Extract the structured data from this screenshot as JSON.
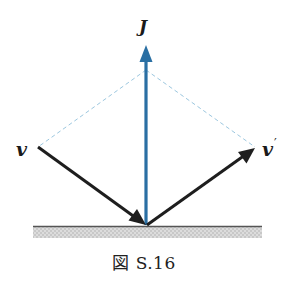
{
  "figure": {
    "caption": "図 S.16",
    "vectors": {
      "J": {
        "label": "J",
        "color": "#2a6fa3",
        "from": [
          146,
          225
        ],
        "to": [
          146,
          45
        ]
      },
      "v": {
        "label": "v",
        "color": "#1e1e1e",
        "from": [
          38,
          147
        ],
        "to": [
          146,
          225
        ]
      },
      "v_prime": {
        "label": "v",
        "prime": "′",
        "color": "#1e1e1e",
        "from": [
          146,
          225
        ],
        "to": [
          255,
          148
        ]
      }
    },
    "construction_lines": {
      "color": "#9cc7df",
      "apex": [
        146,
        70
      ],
      "left_end": [
        38,
        147
      ],
      "right_end": [
        255,
        147
      ]
    },
    "surface": {
      "line_color": "#555555",
      "fill_color": "#d4d4d4",
      "x_start": 33,
      "x_end": 262,
      "y_top": 226,
      "y_bottom": 238
    }
  }
}
